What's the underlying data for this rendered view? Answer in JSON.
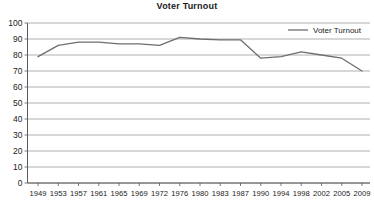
{
  "chart_data": {
    "type": "line",
    "title": "Voter Turnout",
    "xlabel": "",
    "ylabel": "",
    "categories": [
      "1949",
      "1953",
      "1957",
      "1961",
      "1965",
      "1969",
      "1972",
      "1976",
      "1980",
      "1983",
      "1987",
      "1990",
      "1994",
      "1998",
      "2002",
      "2005",
      "2009"
    ],
    "series": [
      {
        "name": "Voter Turnout",
        "color": "#6e6e6e",
        "values": [
          79,
          86,
          88,
          88,
          87,
          87,
          86,
          91,
          90,
          89.5,
          89.5,
          78,
          79,
          82,
          80,
          78,
          70
        ]
      }
    ],
    "ylim": [
      0,
      100
    ],
    "ytick_step": 10,
    "yticks": [
      "0",
      "10",
      "20",
      "30",
      "40",
      "50",
      "60",
      "70",
      "80",
      "90",
      "100"
    ],
    "grid": true,
    "legend_position": "top-right",
    "legend_entries": [
      "Voter Turnout"
    ]
  }
}
